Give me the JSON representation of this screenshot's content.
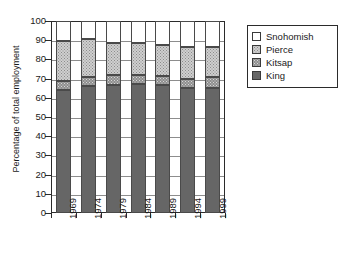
{
  "chart_data": {
    "type": "bar",
    "stacked": true,
    "title": "",
    "xlabel": "",
    "ylabel": "Percentage of total employment",
    "categories": [
      "1969",
      "1974",
      "1979",
      "1984",
      "1989",
      "1994",
      "1999"
    ],
    "ylim": [
      0,
      100
    ],
    "yticks": [
      "0",
      "10",
      "20",
      "30",
      "40",
      "50",
      "60",
      "70",
      "80",
      "90",
      "100"
    ],
    "grid": true,
    "legend_position": "right",
    "series": [
      {
        "name": "King",
        "color": "#666666",
        "pattern": "solid-dark",
        "values": [
          64.0,
          66.0,
          66.5,
          67.0,
          66.5,
          65.0,
          65.0
        ]
      },
      {
        "name": "Kitsap",
        "color": "#8e8e8e",
        "pattern": "dotted-medium",
        "values": [
          5.0,
          5.0,
          5.5,
          5.0,
          5.0,
          5.0,
          6.0
        ]
      },
      {
        "name": "Pierce",
        "color": "#cfcfcf",
        "pattern": "dotted-light",
        "values": [
          20.5,
          19.5,
          16.5,
          16.5,
          16.0,
          16.5,
          15.5
        ]
      },
      {
        "name": "Snohomish",
        "color": "#ffffff",
        "pattern": "empty",
        "values": [
          10.5,
          9.5,
          11.5,
          11.5,
          12.5,
          13.5,
          13.5
        ]
      }
    ],
    "cumulative_tops": {
      "King": [
        64.0,
        66.0,
        66.5,
        67.0,
        66.5,
        65.0,
        65.0
      ],
      "Kitsap": [
        69.0,
        71.0,
        72.0,
        72.0,
        71.5,
        70.0,
        71.0
      ],
      "Pierce": [
        89.5,
        90.5,
        88.5,
        88.5,
        87.5,
        86.5,
        86.5
      ],
      "Snohomish": [
        100.0,
        100.0,
        100.0,
        100.0,
        100.0,
        100.0,
        100.0
      ]
    }
  },
  "legend": {
    "entries": [
      {
        "label": "Snohomish",
        "swatch": "snohomish"
      },
      {
        "label": "Pierce",
        "swatch": "pierce"
      },
      {
        "label": "Kitsap",
        "swatch": "kitsap"
      },
      {
        "label": "King",
        "swatch": "king"
      }
    ]
  }
}
